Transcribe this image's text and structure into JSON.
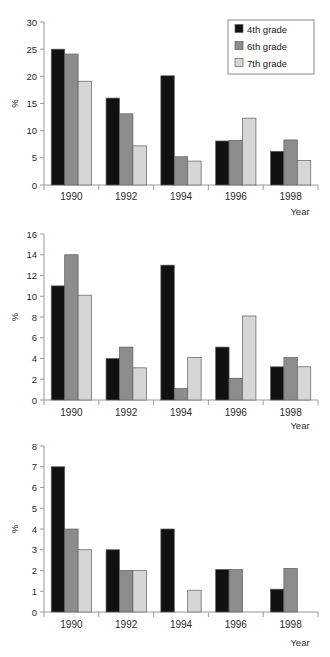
{
  "figure": {
    "series_colors": {
      "4th grade": "#111111",
      "6th grade": "#8c8c8c",
      "7th grade": "#d6d6d6"
    },
    "legend": {
      "position": "top-right",
      "panel": 0,
      "entries": [
        {
          "label": "4th grade",
          "swatch": "#111111"
        },
        {
          "label": "6th grade",
          "swatch": "#8c8c8c"
        },
        {
          "label": "7th grade",
          "swatch": "#d6d6d6"
        }
      ]
    }
  },
  "chart_data": [
    {
      "type": "bar",
      "title": "",
      "xlabel": "Year",
      "ylabel": "%",
      "categories": [
        "1990",
        "1992",
        "1994",
        "1996",
        "1998"
      ],
      "ylim": [
        0,
        30
      ],
      "yticks": [
        0,
        5,
        10,
        15,
        20,
        25,
        30
      ],
      "grid": false,
      "legend": "top-right",
      "series": [
        {
          "name": "4th grade",
          "color": "#111111",
          "values": [
            25.0,
            16.0,
            20.1,
            8.1,
            6.2
          ]
        },
        {
          "name": "6th grade",
          "color": "#8c8c8c",
          "values": [
            24.1,
            13.1,
            5.2,
            8.2,
            8.3
          ]
        },
        {
          "name": "7th grade",
          "color": "#d6d6d6",
          "values": [
            19.1,
            7.2,
            4.4,
            12.3,
            4.5
          ]
        }
      ]
    },
    {
      "type": "bar",
      "title": "",
      "xlabel": "Year",
      "ylabel": "%",
      "categories": [
        "1990",
        "1992",
        "1994",
        "1996",
        "1998"
      ],
      "ylim": [
        0,
        16
      ],
      "yticks": [
        0,
        2,
        4,
        6,
        8,
        10,
        12,
        14,
        16
      ],
      "grid": false,
      "legend": "none",
      "series": [
        {
          "name": "4th grade",
          "color": "#111111",
          "values": [
            11.0,
            4.0,
            13.0,
            5.1,
            3.2
          ]
        },
        {
          "name": "6th grade",
          "color": "#8c8c8c",
          "values": [
            14.0,
            5.1,
            1.1,
            2.1,
            4.1
          ]
        },
        {
          "name": "7th grade",
          "color": "#d6d6d6",
          "values": [
            10.1,
            3.1,
            4.1,
            8.1,
            3.2
          ]
        }
      ]
    },
    {
      "type": "bar",
      "title": "",
      "xlabel": "Year",
      "ylabel": "%",
      "categories": [
        "1990",
        "1992",
        "1994",
        "1996",
        "1998"
      ],
      "ylim": [
        0,
        8
      ],
      "yticks": [
        0,
        1,
        2,
        3,
        4,
        5,
        6,
        7,
        8
      ],
      "grid": false,
      "legend": "none",
      "series": [
        {
          "name": "4th grade",
          "color": "#111111",
          "values": [
            7.0,
            3.0,
            4.0,
            2.05,
            1.1
          ]
        },
        {
          "name": "6th grade",
          "color": "#8c8c8c",
          "values": [
            4.0,
            2.0,
            0,
            2.05,
            2.1
          ]
        },
        {
          "name": "7th grade",
          "color": "#d6d6d6",
          "values": [
            3.0,
            2.0,
            1.05,
            0,
            0
          ]
        }
      ]
    }
  ]
}
